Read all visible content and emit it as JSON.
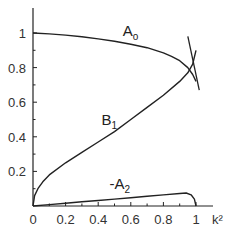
{
  "chart_data": {
    "type": "line",
    "title": "",
    "xlabel": "k²",
    "ylabel": "",
    "xlim": [
      0,
      1.05
    ],
    "ylim": [
      0,
      1.1
    ],
    "grid": false,
    "legend": "inline curve labels",
    "x_ticks": [
      0,
      0.2,
      0.4,
      0.6,
      0.8,
      1
    ],
    "x_tick_labels": [
      "0",
      "0.2",
      "0.4",
      "0.6",
      "0.8",
      "1"
    ],
    "y_ticks": [
      0.2,
      0.4,
      0.6,
      0.8,
      1
    ],
    "y_tick_labels": [
      "0.2",
      "0.4",
      "0.6",
      "0.8",
      "1"
    ],
    "series": [
      {
        "name": "A0",
        "label": "A",
        "subscript": "o",
        "x": [
          0,
          0.1,
          0.2,
          0.3,
          0.4,
          0.5,
          0.6,
          0.7,
          0.8,
          0.85,
          0.9,
          0.95,
          0.98,
          1.0
        ],
        "y": [
          1.0,
          0.995,
          0.988,
          0.978,
          0.966,
          0.952,
          0.935,
          0.915,
          0.885,
          0.865,
          0.84,
          0.8,
          0.76,
          0.72
        ]
      },
      {
        "name": "B1",
        "label": "B",
        "subscript": "1",
        "x": [
          0,
          0.01,
          0.03,
          0.06,
          0.1,
          0.2,
          0.3,
          0.4,
          0.5,
          0.6,
          0.7,
          0.8,
          0.9,
          0.95,
          0.98,
          1.0
        ],
        "y": [
          0,
          0.06,
          0.1,
          0.14,
          0.18,
          0.25,
          0.31,
          0.37,
          0.43,
          0.5,
          0.57,
          0.64,
          0.72,
          0.77,
          0.82,
          0.9
        ]
      },
      {
        "name": "-A2",
        "label": "-A",
        "subscript": "2",
        "x": [
          0,
          0.1,
          0.2,
          0.3,
          0.4,
          0.5,
          0.6,
          0.7,
          0.8,
          0.9,
          0.94,
          0.97,
          0.99,
          1.0
        ],
        "y": [
          0,
          0.008,
          0.016,
          0.024,
          0.032,
          0.04,
          0.048,
          0.056,
          0.064,
          0.072,
          0.075,
          0.065,
          0.04,
          0
        ]
      }
    ],
    "annotations": [
      {
        "text": "A0",
        "x": 0.55,
        "y": 0.98
      },
      {
        "text": "B1",
        "x": 0.42,
        "y": 0.47
      },
      {
        "text": "-A2",
        "x": 0.47,
        "y": 0.1
      }
    ]
  }
}
